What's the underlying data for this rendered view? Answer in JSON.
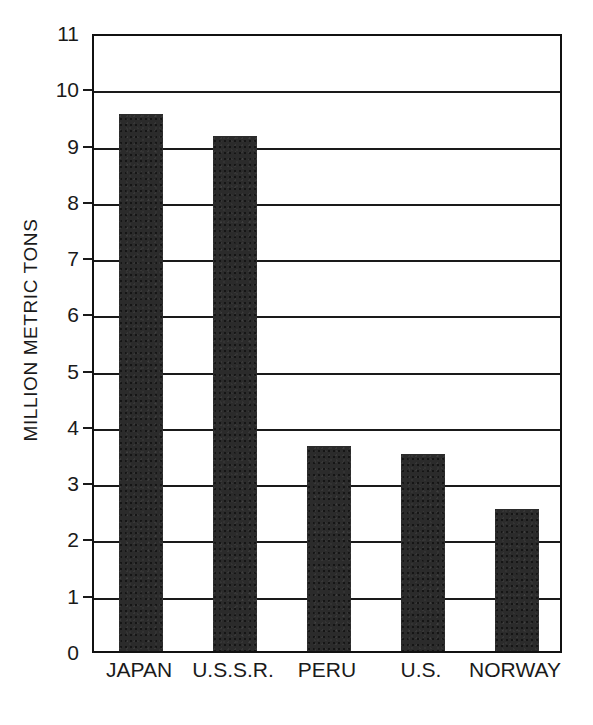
{
  "chart_data": {
    "type": "bar",
    "title": "",
    "subtitle": "",
    "xlabel": "",
    "ylabel": "MILLION METRIC TONS",
    "categories": [
      "JAPAN",
      "U.S.S.R.",
      "PERU",
      "U.S.",
      "NORWAY"
    ],
    "values": [
      9.55,
      9.15,
      3.64,
      3.5,
      2.53
    ],
    "ylim": [
      0,
      11
    ],
    "ytick_labels": [
      "0",
      "1",
      "2",
      "3",
      "4",
      "5",
      "6",
      "7",
      "8",
      "9",
      "10",
      "11"
    ],
    "ytick_values": [
      0,
      1,
      2,
      3,
      4,
      5,
      6,
      7,
      8,
      9,
      10,
      11
    ],
    "grid": true,
    "grid_axis": "y",
    "legend": false,
    "legend_position": "none",
    "annotations": [],
    "bar_color": "#2b2b2b",
    "axis_color": "#111111",
    "background_color": "#ffffff"
  },
  "axes": {
    "y_title": "MILLION METRIC TONS"
  }
}
